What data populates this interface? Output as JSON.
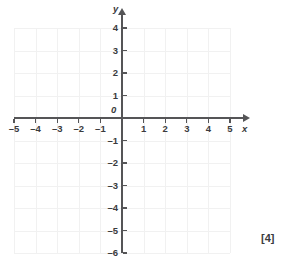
{
  "chart_data": {
    "type": "scatter",
    "title": "",
    "xlabel": "x",
    "ylabel": "y",
    "xlim": [
      -5,
      5
    ],
    "ylim": [
      -6,
      4
    ],
    "grid": true,
    "legend": null,
    "series": [],
    "x_ticks": [
      {
        "value": -5,
        "label": "–5"
      },
      {
        "value": -4,
        "label": "–4"
      },
      {
        "value": -3,
        "label": "–3"
      },
      {
        "value": -2,
        "label": "–2"
      },
      {
        "value": -1,
        "label": "–1"
      },
      {
        "value": 1,
        "label": "1"
      },
      {
        "value": 2,
        "label": "2"
      },
      {
        "value": 3,
        "label": "3"
      },
      {
        "value": 4,
        "label": "4"
      },
      {
        "value": 5,
        "label": "5"
      }
    ],
    "y_ticks": [
      {
        "value": 4,
        "label": "4"
      },
      {
        "value": 3,
        "label": "3"
      },
      {
        "value": 2,
        "label": "2"
      },
      {
        "value": 1,
        "label": "1"
      },
      {
        "value": -1,
        "label": "–1"
      },
      {
        "value": -2,
        "label": "–2"
      },
      {
        "value": -3,
        "label": "–3"
      },
      {
        "value": -4,
        "label": "–4"
      },
      {
        "value": -5,
        "label": "–5"
      },
      {
        "value": -6,
        "label": "–6"
      }
    ],
    "origin_label": "0",
    "x_axis_label": "x",
    "y_axis_label": "y",
    "annotations": [
      {
        "name": "marks",
        "text": "[4]"
      }
    ],
    "colors": {
      "grid": "#f1f1f1",
      "axis": "#555557",
      "text": "#3b3b3d",
      "background": "#ffffff"
    }
  },
  "marks": {
    "text": "[4]"
  }
}
